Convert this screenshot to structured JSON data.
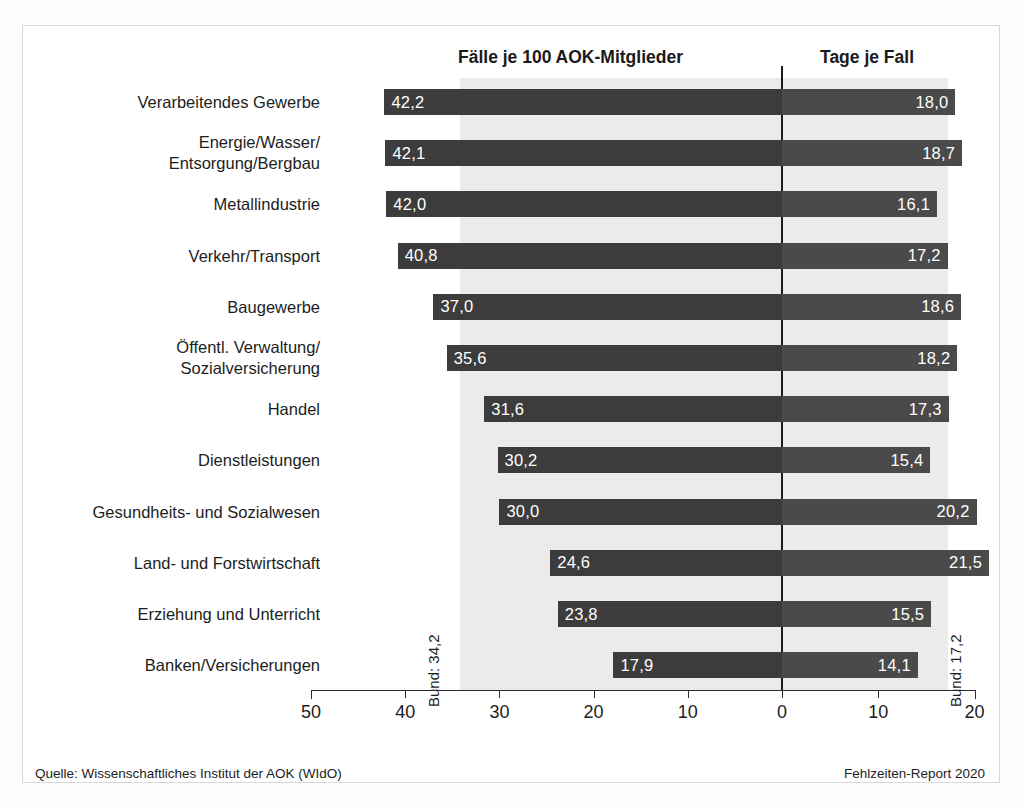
{
  "headers": {
    "left": "Fälle je 100 AOK-Mitglieder",
    "right": "Tage je Fall"
  },
  "annotations": {
    "bund_left": "Bund: 34,2",
    "bund_right": "Bund: 17,2"
  },
  "footer": {
    "source": "Quelle: Wissenschaftliches Institut der AOK (WIdO)",
    "report": "Fehlzeiten-Report 2020"
  },
  "axis": {
    "tick_labels": [
      "50",
      "40",
      "30",
      "20",
      "10",
      "0",
      "10",
      "20"
    ]
  },
  "chart_data": {
    "type": "bar",
    "title": "",
    "subtitle": "",
    "orientation": "horizontal-diverging",
    "categories": [
      "Verarbeitendes Gewerbe",
      "Energie/Wasser/\nEntsorgung/Bergbau",
      "Metallindustrie",
      "Verkehr/Transport",
      "Baugewerbe",
      "Öffentl. Verwaltung/\nSozialversicherung",
      "Handel",
      "Dienstleistungen",
      "Gesundheits- und Sozialwesen",
      "Land- und Forstwirtschaft",
      "Erziehung und Unterricht",
      "Banken/Versicherungen"
    ],
    "series": [
      {
        "name": "Fälle je 100 AOK-Mitglieder",
        "side": "left",
        "color": "#3c3c3c",
        "values": [
          42.2,
          42.1,
          42.0,
          40.8,
          37.0,
          35.6,
          31.6,
          30.2,
          30.0,
          24.6,
          23.8,
          17.9
        ],
        "labels": [
          "42,2",
          "42,1",
          "42,0",
          "40,8",
          "37,0",
          "35,6",
          "31,6",
          "30,2",
          "30,0",
          "24,6",
          "23,8",
          "17,9"
        ],
        "axis_ticks": [
          50,
          40,
          30,
          20,
          10,
          0
        ],
        "axis_range": [
          50,
          0
        ],
        "reference_line": {
          "label": "Bund: 34,2",
          "value": 34.2
        }
      },
      {
        "name": "Tage je Fall",
        "side": "right",
        "color": "#4a4a4a",
        "values": [
          18.0,
          18.7,
          16.1,
          17.2,
          18.6,
          18.2,
          17.3,
          15.4,
          20.2,
          21.5,
          15.5,
          14.1
        ],
        "labels": [
          "18,0",
          "18,7",
          "16,1",
          "17,2",
          "18,6",
          "18,2",
          "17,3",
          "15,4",
          "20,2",
          "21,5",
          "15,5",
          "14,1"
        ],
        "axis_ticks": [
          0,
          10,
          20
        ],
        "axis_range": [
          0,
          20
        ],
        "reference_line": {
          "label": "Bund: 17,2",
          "value": 17.2
        }
      }
    ],
    "xlabel": "",
    "ylabel": "",
    "grid": false,
    "legend": "none"
  }
}
